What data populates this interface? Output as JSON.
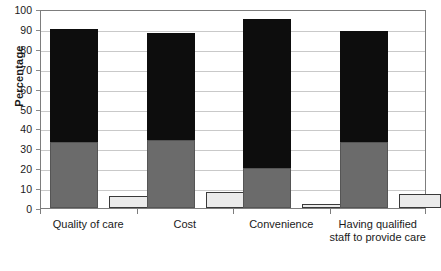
{
  "chart_data": {
    "type": "bar",
    "title": "",
    "subtitle": "",
    "xlabel": "",
    "ylabel": "Percentage",
    "ylim": [
      0,
      100
    ],
    "grid": true,
    "legend": "none",
    "bar_style": "grouped-stacked",
    "categories": [
      "Quality of care",
      "Cost",
      "Convenience",
      "Having qualified staff to provide care"
    ],
    "y_ticks": [
      0,
      10,
      20,
      30,
      40,
      50,
      60,
      70,
      80,
      90,
      100
    ],
    "y_tick_labels": [
      "0",
      "10",
      "20",
      "30",
      "40",
      "50",
      "60",
      "70",
      "80",
      "90",
      "100"
    ],
    "series": [
      {
        "name": "Very important",
        "color": "#0d0d0d",
        "values": [
          57,
          54,
          75,
          56
        ]
      },
      {
        "name": "Somewhat important",
        "color": "#6b6b6b",
        "values": [
          33,
          34,
          20,
          33
        ]
      },
      {
        "name": "Not important",
        "color": "#ebebeb",
        "values": [
          6,
          8,
          2,
          7
        ]
      }
    ],
    "stacked_totals": [
      90,
      88,
      95,
      89
    ]
  },
  "axes": {
    "y_title": "Percentage"
  }
}
